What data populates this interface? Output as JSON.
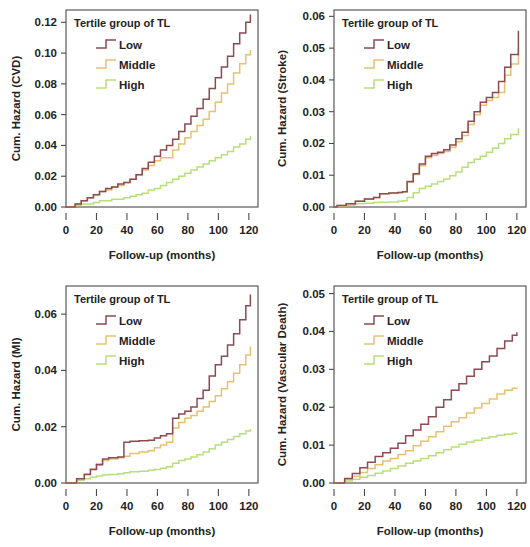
{
  "figure": {
    "panel_count": 4,
    "legend_title": "Tertile group of TL",
    "xlabel": "Follow-up (months)",
    "series_names": [
      "Low",
      "Middle",
      "High"
    ],
    "colors": {
      "low": "#8c4a52",
      "middle": "#e8c170",
      "high": "#b6e07a"
    }
  },
  "chart_data": [
    {
      "type": "line",
      "id": "cvd",
      "title": "Tertile group of TL",
      "xlabel": "Follow-up (months)",
      "ylabel": "Cum. Hazard (CVD)",
      "xlim": [
        0,
        126
      ],
      "ylim": [
        0,
        0.128
      ],
      "xticks": [
        0,
        20,
        40,
        60,
        80,
        100,
        120
      ],
      "yticks": [
        0.0,
        0.02,
        0.04,
        0.06,
        0.08,
        0.1,
        0.12
      ],
      "ytick_labels": [
        "0.00",
        "0.02",
        "0.04",
        "0.06",
        "0.08",
        "0.10",
        "0.12"
      ],
      "grid": false,
      "legend_position": "top-left",
      "series": [
        {
          "name": "Low",
          "color": "#8c4a52",
          "x": [
            2,
            6,
            10,
            14,
            18,
            22,
            26,
            30,
            34,
            38,
            42,
            46,
            50,
            54,
            58,
            62,
            66,
            70,
            74,
            78,
            82,
            86,
            90,
            94,
            98,
            102,
            106,
            110,
            114,
            118,
            121
          ],
          "values": [
            0.0,
            0.002,
            0.004,
            0.006,
            0.008,
            0.01,
            0.012,
            0.013,
            0.015,
            0.016,
            0.018,
            0.021,
            0.025,
            0.029,
            0.033,
            0.037,
            0.04,
            0.044,
            0.049,
            0.054,
            0.059,
            0.064,
            0.07,
            0.077,
            0.084,
            0.091,
            0.098,
            0.106,
            0.113,
            0.12,
            0.125
          ]
        },
        {
          "name": "Middle",
          "color": "#e8c170",
          "x": [
            2,
            6,
            10,
            14,
            18,
            22,
            26,
            30,
            34,
            38,
            42,
            46,
            50,
            54,
            58,
            62,
            66,
            70,
            74,
            78,
            82,
            86,
            90,
            94,
            98,
            102,
            106,
            110,
            114,
            118,
            121
          ],
          "values": [
            0.0,
            0.002,
            0.004,
            0.006,
            0.008,
            0.01,
            0.011,
            0.013,
            0.014,
            0.016,
            0.018,
            0.021,
            0.024,
            0.027,
            0.03,
            0.032,
            0.032,
            0.037,
            0.041,
            0.045,
            0.049,
            0.053,
            0.057,
            0.062,
            0.068,
            0.074,
            0.08,
            0.087,
            0.093,
            0.099,
            0.102
          ]
        },
        {
          "name": "High",
          "color": "#b6e07a",
          "x": [
            2,
            6,
            10,
            14,
            18,
            22,
            26,
            30,
            34,
            38,
            42,
            46,
            50,
            54,
            58,
            62,
            66,
            70,
            74,
            78,
            82,
            86,
            90,
            94,
            98,
            102,
            106,
            110,
            114,
            118,
            121
          ],
          "values": [
            0.0,
            0.001,
            0.002,
            0.002,
            0.003,
            0.004,
            0.004,
            0.005,
            0.005,
            0.006,
            0.007,
            0.008,
            0.009,
            0.011,
            0.012,
            0.014,
            0.016,
            0.018,
            0.02,
            0.022,
            0.024,
            0.026,
            0.028,
            0.03,
            0.032,
            0.034,
            0.036,
            0.039,
            0.041,
            0.044,
            0.046
          ]
        }
      ]
    },
    {
      "type": "line",
      "id": "stroke",
      "title": "Tertile group of TL",
      "xlabel": "Follow-up (months)",
      "ylabel": "Cum. Hazard (Stroke)",
      "xlim": [
        0,
        126
      ],
      "ylim": [
        0,
        0.062
      ],
      "xticks": [
        0,
        20,
        40,
        60,
        80,
        100,
        120
      ],
      "yticks": [
        0.0,
        0.01,
        0.02,
        0.03,
        0.04,
        0.05,
        0.06
      ],
      "ytick_labels": [
        "0.00",
        "0.01",
        "0.02",
        "0.03",
        "0.04",
        "0.05",
        "0.06"
      ],
      "grid": false,
      "legend_position": "top-left",
      "series": [
        {
          "name": "Low",
          "color": "#8c4a52",
          "x": [
            2,
            8,
            14,
            20,
            26,
            30,
            36,
            42,
            45,
            48,
            52,
            56,
            60,
            64,
            68,
            72,
            76,
            80,
            84,
            88,
            92,
            96,
            100,
            104,
            108,
            112,
            116,
            121
          ],
          "values": [
            0.0005,
            0.001,
            0.0018,
            0.0025,
            0.003,
            0.0042,
            0.0044,
            0.0046,
            0.0048,
            0.008,
            0.0105,
            0.0135,
            0.016,
            0.0168,
            0.0172,
            0.018,
            0.0195,
            0.0215,
            0.0235,
            0.027,
            0.03,
            0.033,
            0.0345,
            0.036,
            0.0395,
            0.044,
            0.048,
            0.0555
          ]
        },
        {
          "name": "Middle",
          "color": "#e8c170",
          "x": [
            2,
            8,
            14,
            20,
            26,
            30,
            36,
            42,
            45,
            48,
            52,
            56,
            60,
            64,
            68,
            72,
            76,
            80,
            84,
            88,
            92,
            96,
            100,
            104,
            108,
            112,
            116,
            121
          ],
          "values": [
            0.0005,
            0.001,
            0.0018,
            0.0025,
            0.003,
            0.0042,
            0.0044,
            0.0046,
            0.0048,
            0.0078,
            0.0102,
            0.013,
            0.0155,
            0.0163,
            0.0168,
            0.0175,
            0.0188,
            0.0205,
            0.0225,
            0.026,
            0.029,
            0.032,
            0.0335,
            0.0345,
            0.036,
            0.0415,
            0.045,
            0.05
          ]
        },
        {
          "name": "High",
          "color": "#b6e07a",
          "x": [
            2,
            8,
            14,
            20,
            26,
            30,
            36,
            42,
            45,
            48,
            52,
            56,
            60,
            64,
            68,
            72,
            76,
            80,
            84,
            88,
            92,
            96,
            100,
            104,
            108,
            112,
            116,
            121
          ],
          "values": [
            0.0002,
            0.0005,
            0.001,
            0.0012,
            0.0014,
            0.0015,
            0.0016,
            0.0018,
            0.002,
            0.003,
            0.0045,
            0.0058,
            0.0065,
            0.0072,
            0.008,
            0.0088,
            0.0098,
            0.011,
            0.0125,
            0.014,
            0.015,
            0.016,
            0.0172,
            0.0185,
            0.02,
            0.0215,
            0.0228,
            0.0248
          ]
        }
      ]
    },
    {
      "type": "line",
      "id": "mi",
      "title": "Tertile group of TL",
      "xlabel": "Follow-up (months)",
      "ylabel": "Cum. Hazard (MI)",
      "xlim": [
        0,
        126
      ],
      "ylim": [
        0,
        0.07
      ],
      "xticks": [
        0,
        20,
        40,
        60,
        80,
        100,
        120
      ],
      "yticks": [
        0.0,
        0.02,
        0.04,
        0.06
      ],
      "ytick_labels": [
        "0.00",
        "0.02",
        "0.04",
        "0.06"
      ],
      "grid": false,
      "legend_position": "top-left",
      "series": [
        {
          "name": "Low",
          "color": "#8c4a52",
          "x": [
            7,
            12,
            16,
            20,
            24,
            28,
            34,
            38,
            42,
            48,
            54,
            58,
            62,
            66,
            70,
            74,
            78,
            82,
            86,
            90,
            94,
            98,
            102,
            106,
            110,
            114,
            118,
            121
          ],
          "values": [
            0.0015,
            0.003,
            0.0048,
            0.0065,
            0.0085,
            0.009,
            0.0092,
            0.0145,
            0.0148,
            0.015,
            0.0152,
            0.016,
            0.0168,
            0.0175,
            0.023,
            0.0245,
            0.0255,
            0.027,
            0.03,
            0.033,
            0.038,
            0.042,
            0.045,
            0.049,
            0.053,
            0.058,
            0.063,
            0.067
          ]
        },
        {
          "name": "Middle",
          "color": "#e8c170",
          "x": [
            7,
            12,
            16,
            20,
            24,
            28,
            34,
            38,
            42,
            48,
            54,
            58,
            62,
            66,
            70,
            74,
            78,
            82,
            86,
            90,
            94,
            98,
            102,
            106,
            110,
            114,
            118,
            121
          ],
          "values": [
            0.0015,
            0.0032,
            0.005,
            0.0068,
            0.008,
            0.0085,
            0.009,
            0.0095,
            0.0105,
            0.011,
            0.0115,
            0.0125,
            0.0135,
            0.0145,
            0.0195,
            0.0215,
            0.023,
            0.024,
            0.0255,
            0.027,
            0.029,
            0.031,
            0.0335,
            0.036,
            0.039,
            0.042,
            0.0455,
            0.0485
          ]
        },
        {
          "name": "High",
          "color": "#b6e07a",
          "x": [
            7,
            12,
            16,
            20,
            24,
            28,
            34,
            38,
            42,
            48,
            54,
            58,
            62,
            66,
            70,
            74,
            78,
            82,
            86,
            90,
            94,
            98,
            102,
            106,
            110,
            114,
            118,
            121
          ],
          "values": [
            0.001,
            0.0015,
            0.002,
            0.0025,
            0.0028,
            0.003,
            0.0033,
            0.0036,
            0.004,
            0.0042,
            0.0045,
            0.0048,
            0.0052,
            0.0058,
            0.007,
            0.008,
            0.0085,
            0.0092,
            0.01,
            0.011,
            0.0122,
            0.0135,
            0.0145,
            0.0155,
            0.0165,
            0.0175,
            0.0185,
            0.0192
          ]
        }
      ]
    },
    {
      "type": "line",
      "id": "vascular-death",
      "title": "Tertile group of TL",
      "xlabel": "Follow-up (months)",
      "ylabel": "Cum. Hazard (Vascular Death)",
      "xlim": [
        0,
        126
      ],
      "ylim": [
        0,
        0.052
      ],
      "xticks": [
        0,
        20,
        40,
        60,
        80,
        100,
        120
      ],
      "yticks": [
        0.0,
        0.01,
        0.02,
        0.03,
        0.04,
        0.05
      ],
      "ytick_labels": [
        "0.00",
        "0.01",
        "0.02",
        "0.03",
        "0.04",
        "0.05"
      ],
      "grid": false,
      "legend_position": "top-left",
      "series": [
        {
          "name": "Low",
          "color": "#8c4a52",
          "x": [
            7,
            12,
            17,
            22,
            27,
            32,
            37,
            42,
            47,
            52,
            57,
            62,
            67,
            72,
            77,
            82,
            87,
            92,
            97,
            102,
            107,
            112,
            117,
            120
          ],
          "values": [
            0.0012,
            0.0025,
            0.004,
            0.0055,
            0.007,
            0.008,
            0.0092,
            0.0105,
            0.0125,
            0.014,
            0.0155,
            0.0175,
            0.02,
            0.022,
            0.0245,
            0.0262,
            0.0282,
            0.03,
            0.032,
            0.0335,
            0.0355,
            0.0375,
            0.039,
            0.0398
          ]
        },
        {
          "name": "Middle",
          "color": "#e8c170",
          "x": [
            7,
            12,
            17,
            22,
            27,
            32,
            37,
            42,
            47,
            52,
            57,
            62,
            67,
            72,
            77,
            82,
            87,
            92,
            97,
            102,
            107,
            112,
            117,
            120
          ],
          "values": [
            0.001,
            0.0018,
            0.0028,
            0.0038,
            0.0048,
            0.0058,
            0.0065,
            0.0075,
            0.0085,
            0.0098,
            0.011,
            0.0122,
            0.0135,
            0.015,
            0.0162,
            0.0172,
            0.0185,
            0.0198,
            0.021,
            0.0222,
            0.0235,
            0.0245,
            0.025,
            0.0252
          ]
        },
        {
          "name": "High",
          "color": "#b6e07a",
          "x": [
            7,
            12,
            17,
            22,
            27,
            32,
            37,
            42,
            47,
            52,
            57,
            62,
            67,
            72,
            77,
            82,
            87,
            92,
            97,
            102,
            107,
            112,
            117,
            120
          ],
          "values": [
            0.0005,
            0.001,
            0.0015,
            0.002,
            0.0026,
            0.0032,
            0.0038,
            0.0045,
            0.0052,
            0.0058,
            0.0065,
            0.0072,
            0.008,
            0.0088,
            0.0095,
            0.0102,
            0.0108,
            0.0113,
            0.0118,
            0.0122,
            0.0126,
            0.0129,
            0.0131,
            0.0132
          ]
        }
      ]
    }
  ]
}
